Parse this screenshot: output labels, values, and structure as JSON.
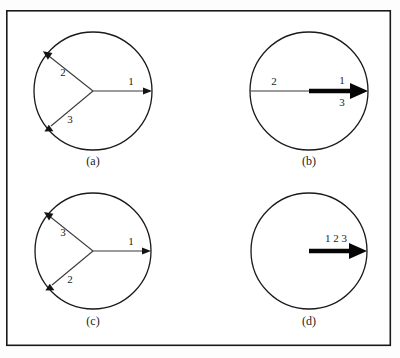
{
  "figure": {
    "background_color": "#fdfdfd",
    "frame_color": "#1a1a1a",
    "thin_stroke_color": "#3b3b3b",
    "thick_stroke_color": "#050505",
    "frame": {
      "x": 6,
      "y": 10,
      "width": 385,
      "height": 336
    },
    "panels": [
      {
        "id": "panel-a",
        "caption": "(a)",
        "caption_x": 93,
        "caption_y": 162,
        "circle": {
          "cx": 93,
          "cy": 91,
          "r": 59
        },
        "vectors": [
          {
            "name": "vector-1",
            "label": "1",
            "angle_deg": 0,
            "style": "thin",
            "label_x": 131,
            "label_y": 82
          },
          {
            "name": "vector-2",
            "label": "2",
            "angle_deg": 210,
            "style": "thin",
            "label_x": 63,
            "label_y": 73
          },
          {
            "name": "vector-3",
            "label": "3",
            "angle_deg": 145,
            "style": "thin",
            "label_x": 70,
            "label_y": 120
          }
        ]
      },
      {
        "id": "panel-b",
        "caption": "(b)",
        "caption_x": 309,
        "caption_y": 162,
        "circle": {
          "cx": 309,
          "cy": 91,
          "r": 59
        },
        "vectors": [
          {
            "name": "vector-2",
            "label": "2",
            "angle_deg": 180,
            "style": "thin",
            "label_x": 274,
            "label_y": 82
          },
          {
            "name": "vector-1-3",
            "label": "1",
            "angle_deg": 0,
            "style": "thick",
            "label_x": 342,
            "label_y": 81
          },
          {
            "name": "vector-3-below",
            "label": "3",
            "angle_deg": 0,
            "style": "none",
            "label_x": 342,
            "label_y": 102
          }
        ]
      },
      {
        "id": "panel-c",
        "caption": "(c)",
        "caption_x": 93,
        "caption_y": 322,
        "circle": {
          "cx": 93,
          "cy": 251,
          "r": 58
        },
        "vectors": [
          {
            "name": "vector-1",
            "label": "1",
            "angle_deg": 0,
            "style": "thin",
            "label_x": 131,
            "label_y": 242
          },
          {
            "name": "vector-3",
            "label": "3",
            "angle_deg": 210,
            "style": "thin",
            "label_x": 63,
            "label_y": 233
          },
          {
            "name": "vector-2",
            "label": "2",
            "angle_deg": 145,
            "style": "thin",
            "label_x": 70,
            "label_y": 280
          }
        ]
      },
      {
        "id": "panel-d",
        "caption": "(d)",
        "caption_x": 309,
        "caption_y": 322,
        "circle": {
          "cx": 309,
          "cy": 251,
          "r": 58
        },
        "vectors": [
          {
            "name": "vector-1-2-3",
            "label": "1 2 3",
            "angle_deg": 0,
            "style": "thick",
            "label_x": 336,
            "label_y": 239
          }
        ]
      }
    ]
  },
  "labels": {
    "panel_a_caption": "(a)",
    "panel_b_caption": "(b)",
    "panel_c_caption": "(c)",
    "panel_d_caption": "(d)",
    "a_v1": "1",
    "a_v2": "2",
    "a_v3": "3",
    "b_v2": "2",
    "b_v1": "1",
    "b_v3": "3",
    "c_v1": "1",
    "c_v3": "3",
    "c_v2": "2",
    "d_v123": "1 2 3"
  }
}
